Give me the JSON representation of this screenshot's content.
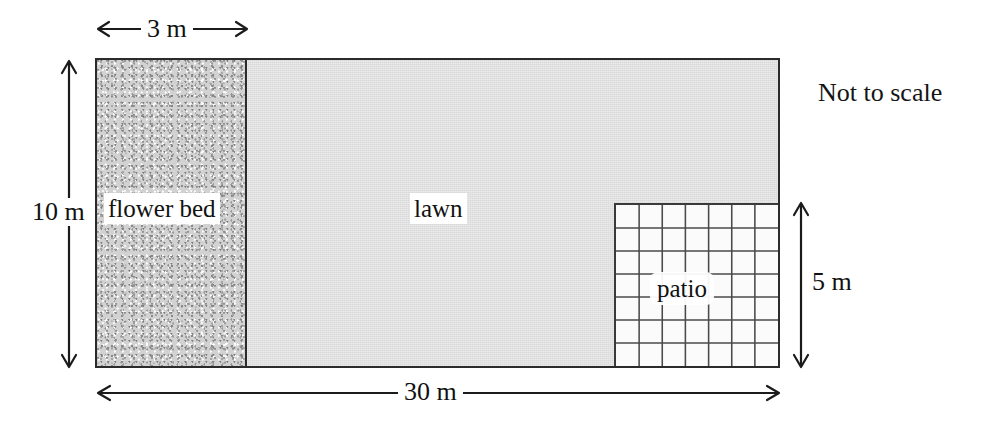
{
  "diagram": {
    "note": "Not to scale",
    "regions": [
      {
        "key": "flower_bed",
        "label": "flower bed",
        "fill": "speckled-grey",
        "color": "#d2d2d2"
      },
      {
        "key": "lawn",
        "label": "lawn",
        "fill": "light-grey",
        "color": "#d9d9d9"
      },
      {
        "key": "patio",
        "label": "patio",
        "fill": "white-grid",
        "color": "#fbfbfb"
      }
    ],
    "dimensions": [
      {
        "key": "flower_bed_width",
        "label": "3 m",
        "value": 3,
        "unit": "m",
        "orientation": "horizontal",
        "position": "top"
      },
      {
        "key": "plot_height",
        "label": "10 m",
        "value": 10,
        "unit": "m",
        "orientation": "vertical",
        "position": "left"
      },
      {
        "key": "plot_width",
        "label": "30 m",
        "value": 30,
        "unit": "m",
        "orientation": "horizontal",
        "position": "bottom"
      },
      {
        "key": "patio_height",
        "label": "5 m",
        "value": 5,
        "unit": "m",
        "orientation": "vertical",
        "position": "right"
      }
    ],
    "patio": {
      "columns": 7,
      "rows": 7,
      "label": "patio"
    },
    "colors": {
      "outline": "#2b2b2b",
      "lawn": "#d9d9d9",
      "flower_bed": "#d2d2d2",
      "patio": "#fbfbfb",
      "patio_grid": "#4a4a4a",
      "text": "#111111",
      "background": "#ffffff"
    }
  }
}
